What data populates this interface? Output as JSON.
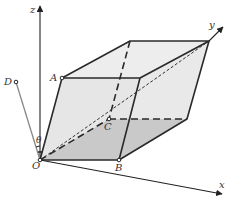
{
  "diagram": {
    "type": "3d-parallelepiped-coordinate-system",
    "axes": {
      "x": {
        "label": "x"
      },
      "y": {
        "label": "y"
      },
      "z": {
        "label": "z"
      }
    },
    "points": {
      "O": {
        "label": "O"
      },
      "A": {
        "label": "A"
      },
      "B": {
        "label": "B"
      },
      "C": {
        "label": "C"
      },
      "D": {
        "label": "D"
      }
    },
    "angle": {
      "label": "θ"
    },
    "colors": {
      "edge": "#2a2a2a",
      "face_light": "#ebebeb",
      "face_dark": "#c8c8c8",
      "axis": "#222222",
      "od_line": "#888888"
    }
  }
}
